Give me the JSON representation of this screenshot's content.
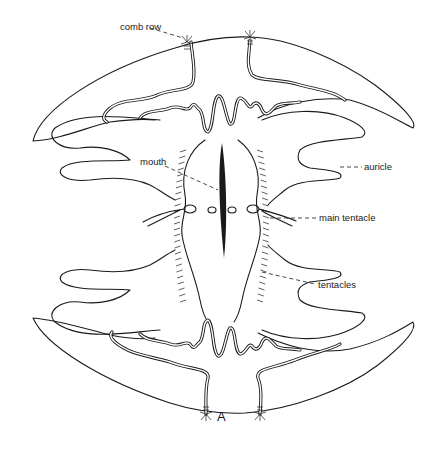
{
  "figure": {
    "letter": "A",
    "labels": {
      "comb_row": "comb row",
      "mouth": "mouth",
      "auricle": "auricle",
      "main_tentacle": "main tentacle",
      "tentacles": "tentacles"
    }
  },
  "colors": {
    "ink": "#1a1a1a",
    "background": "#ffffff"
  }
}
